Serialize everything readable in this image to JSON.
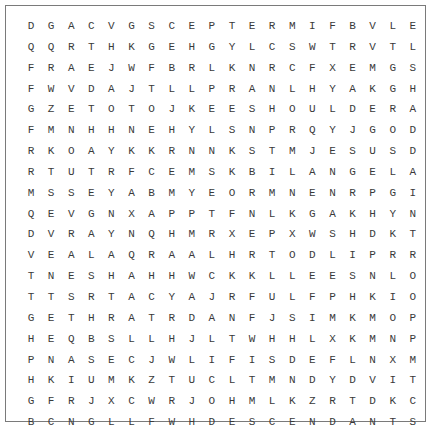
{
  "puzzle": {
    "rows": [
      "DGACVGSCEPTERMIFBVLE",
      "QQRTHKGEHGYLCSWTRVTL",
      "FRAEJWFBRLKNRCFXEMGS",
      "FWVDAJTLLPRANLHYAKGH",
      "GZETOTOJKEESHOULDERA",
      "FMNHHNEHYLSNPRQYJGOD",
      "RKOAYKKRNNKSTMJESUSD",
      "RTUTRFCEMSKBILANGELA",
      "MSSEYABMYEORMNENRPGI",
      "QEVGNXAPPTFNLKGAKHYN",
      "DVRAYNQHMRXEPXWSHDKT",
      "VEALAQRAALHRTODLIPRR",
      "TNESHAHHWCKKLLEESNLO",
      "TTSRTACYAJRFULFPHKIO",
      "GETHRATRDANFJSIMKMOP",
      "HEQBSLLHJLTWHHLXKMNP",
      "PNASECJWLIFISDEFLNXM",
      "HKIUMKZTUCLTMNDYDVIT",
      "GFRJXCWRJOHMLKZRTDKC",
      "BCNGLLFWHDESCENDANTS"
    ]
  }
}
